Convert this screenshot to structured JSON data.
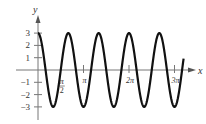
{
  "chart_data": {
    "type": "line",
    "title": "",
    "function": "y = 3 cos(3x)",
    "xlabel": "x",
    "ylabel": "y",
    "xlim": [
      -0.1,
      3.35
    ],
    "ylim": [
      -3.3,
      3.3
    ],
    "x_unit": "pi",
    "x_ticks": [
      {
        "value": 0.5,
        "label": "π/2"
      },
      {
        "value": 1,
        "label": "π"
      },
      {
        "value": 2,
        "label": "2π"
      },
      {
        "value": 3,
        "label": "3π"
      }
    ],
    "y_ticks": [
      {
        "value": 3,
        "label": "3"
      },
      {
        "value": 2,
        "label": "2"
      },
      {
        "value": 1,
        "label": "1"
      },
      {
        "value": -1,
        "label": "−1"
      },
      {
        "value": -2,
        "label": "−2"
      },
      {
        "value": -3,
        "label": "−3"
      }
    ],
    "series": [
      {
        "name": "3cos(3x)",
        "amplitude": 3,
        "angular_frequency": 3,
        "x_start_pi": 0,
        "x_end_pi": 3.2,
        "color": "#111111"
      }
    ],
    "grid": false,
    "legend": null
  },
  "axes": {
    "x_label": "x",
    "y_label": "y"
  }
}
